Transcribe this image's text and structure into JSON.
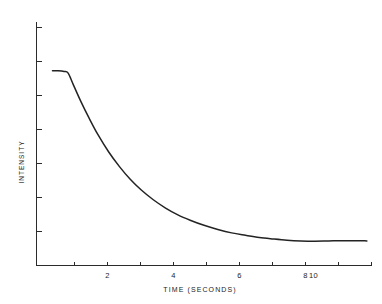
{
  "chart_data": {
    "type": "line",
    "title": "",
    "xlabel": "TIME (SECONDS)",
    "ylabel": "INTENSITY",
    "xlim": [
      0,
      10.9
    ],
    "ylim": [
      0,
      1
    ],
    "grid": false,
    "legend": "none",
    "x_ticks": [
      {
        "value": 1,
        "label": ""
      },
      {
        "value": 2,
        "label": "2"
      },
      {
        "value": 3,
        "label": ""
      },
      {
        "value": 4,
        "label": "4"
      },
      {
        "value": 5,
        "label": ""
      },
      {
        "value": 6,
        "label": "6"
      },
      {
        "value": 7,
        "label": ""
      },
      {
        "value": 8,
        "label": "8"
      },
      {
        "value": 9,
        "label": ""
      },
      {
        "value": 10,
        "label": "10"
      }
    ],
    "x_tick_labels": [
      "2",
      "4",
      "6",
      "8",
      "10"
    ],
    "y_ticks": [
      {
        "value": 0.13,
        "label": ""
      },
      {
        "value": 0.27,
        "label": ""
      },
      {
        "value": 0.41,
        "label": ""
      },
      {
        "value": 0.55,
        "label": ""
      },
      {
        "value": 0.69,
        "label": ""
      },
      {
        "value": 0.83,
        "label": ""
      },
      {
        "value": 0.97,
        "label": ""
      }
    ],
    "y_tick_labels": [],
    "series": [
      {
        "name": "intensity-decay",
        "color": "#232323",
        "x": [
          0.52,
          0.7,
          0.9,
          1.03,
          1.2,
          1.45,
          1.7,
          2.0,
          2.35,
          2.7,
          3.05,
          3.4,
          3.8,
          4.2,
          4.6,
          5.0,
          5.45,
          5.9,
          6.35,
          6.8,
          7.25,
          7.7,
          8.15,
          8.6,
          9.05,
          9.5,
          9.95,
          10.4,
          10.75
        ],
        "y": [
          0.8,
          0.8,
          0.797,
          0.79,
          0.742,
          0.672,
          0.608,
          0.537,
          0.466,
          0.406,
          0.354,
          0.311,
          0.27,
          0.236,
          0.208,
          0.186,
          0.165,
          0.148,
          0.134,
          0.124,
          0.115,
          0.109,
          0.104,
          0.101,
          0.1,
          0.101,
          0.102,
          0.102,
          0.101
        ]
      }
    ],
    "annotations": []
  },
  "figure": {
    "xlabel": "TIME (SECONDS)",
    "ylabel": "INTENSITY"
  }
}
